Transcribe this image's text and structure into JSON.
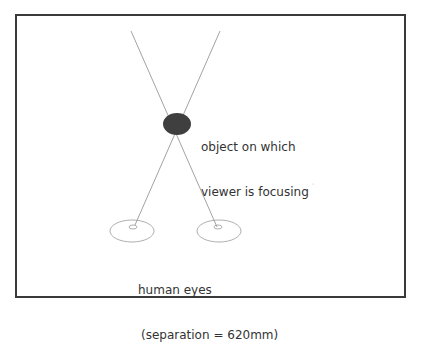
{
  "diagram": {
    "object_label": {
      "line1": "object on which",
      "line2": "viewer is focusing"
    },
    "eyes_label": {
      "line1": "human eyes",
      "line2": "(separation = 620mm)"
    },
    "colors": {
      "frame": "#3a3a3a",
      "lines": "#8a8a8a",
      "object_fill": "#3f3f3f",
      "eye_stroke": "#9a9a9a",
      "text": "#333333"
    }
  }
}
